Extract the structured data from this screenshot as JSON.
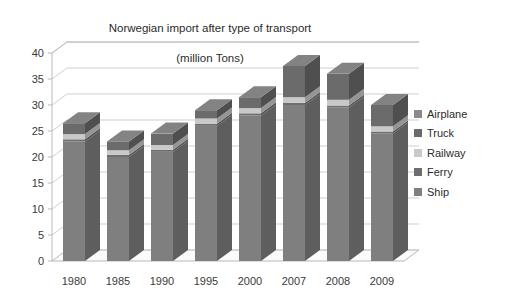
{
  "chart_data": {
    "type": "bar",
    "subtype": "stacked-3d-column",
    "title": "Norwegian import after type of transport\n(million Tons)",
    "title_line1": "Norwegian import after type of transport",
    "title_line2": "(million Tons)",
    "xlabel": "",
    "ylabel": "",
    "ylim": [
      0,
      40
    ],
    "ytick_step": 5,
    "yticks": [
      0,
      5,
      10,
      15,
      20,
      25,
      30,
      35,
      40
    ],
    "grid": true,
    "grid_orientation": "horizontal",
    "legend_position": "right",
    "categories": [
      "1980",
      "1985",
      "1990",
      "1995",
      "2000",
      "2007",
      "2008",
      "2009"
    ],
    "series": [
      {
        "name": "Ship",
        "color": "#7f7f7f",
        "values": [
          23.0,
          20.0,
          21.0,
          26.0,
          28.0,
          30.0,
          29.5,
          24.5
        ]
      },
      {
        "name": "Ferry",
        "color": "#6e6e6e",
        "values": [
          0.4,
          0.4,
          0.4,
          0.4,
          0.4,
          0.4,
          0.4,
          0.4
        ]
      },
      {
        "name": "Railway",
        "color": "#c9c9c9",
        "values": [
          1.0,
          0.9,
          0.9,
          1.0,
          1.0,
          1.1,
          1.1,
          1.0
        ]
      },
      {
        "name": "Truck",
        "color": "#6b6b6b",
        "values": [
          2.1,
          1.7,
          2.2,
          1.6,
          2.1,
          6.0,
          5.0,
          4.1
        ]
      },
      {
        "name": "Airplane",
        "color": "#8a8a8a",
        "values": [
          0.0,
          0.0,
          0.0,
          0.0,
          0.0,
          0.0,
          0.0,
          0.0
        ]
      }
    ],
    "totals": [
      26.5,
      23.0,
      24.5,
      29.0,
      31.5,
      37.5,
      36.0,
      30.0
    ]
  },
  "legend": {
    "items": [
      {
        "label": "Airplane",
        "color": "#8a8a8a"
      },
      {
        "label": "Truck",
        "color": "#6b6b6b"
      },
      {
        "label": "Railway",
        "color": "#c9c9c9"
      },
      {
        "label": "Ferry",
        "color": "#6e6e6e"
      },
      {
        "label": "Ship",
        "color": "#7f7f7f"
      }
    ]
  },
  "colors": {
    "bar_front": "#7f7f7f",
    "bar_side": "#5f5f5f",
    "bar_top": "#9a9a9a",
    "railway_front": "#c9c9c9",
    "railway_side": "#a8a8a8",
    "truck_front": "#6b6b6b",
    "truck_side": "#515151",
    "axis": "#b9b9b9",
    "grid": "#cfcfcf",
    "floor": "#fbfbfb",
    "text": "#2b2b2b"
  }
}
